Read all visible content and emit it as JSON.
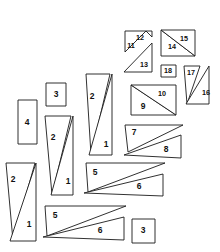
{
  "canvas": {
    "width": 220,
    "height": 252,
    "background": "#ffffff",
    "stroke_color": "#1a1a1a",
    "label_color": "#111111",
    "type": "packing-diagram"
  },
  "pieces": [
    {
      "id": "p-4",
      "label": "4",
      "shape": "rectangle",
      "points": "18,100 37,100 37,144 18,144"
    },
    {
      "id": "p-3-upper",
      "label": "3",
      "shape": "rectangle",
      "points": "46,83 66,83 66,106 46,106"
    },
    {
      "id": "p-3-lower",
      "label": "3",
      "shape": "rectangle",
      "points": "132,219 155,219 155,243 132,243"
    },
    {
      "id": "p-2-left",
      "label": "2",
      "shape": "triangle",
      "points": "6,163 35,163 13,241"
    },
    {
      "id": "p-1-left",
      "label": "1",
      "shape": "triangle",
      "points": "36,163 36,241 10,241"
    },
    {
      "id": "p-2-mid",
      "label": "2",
      "shape": "triangle",
      "points": "45,116 71,116 52,195"
    },
    {
      "id": "p-1-mid",
      "label": "1",
      "shape": "triangle",
      "points": "73,116 73,195 51,195"
    },
    {
      "id": "p-2-tall",
      "label": "2",
      "shape": "triangle",
      "points": "86,74 110,74 91,155"
    },
    {
      "id": "p-1-tall",
      "label": "1",
      "shape": "triangle",
      "points": "112,74 112,155 89,155"
    },
    {
      "id": "p-7",
      "label": "7",
      "shape": "triangle",
      "points": "125,125 183,125 128,152"
    },
    {
      "id": "p-8",
      "label": "8",
      "shape": "triangle",
      "points": "181,135 181,158 124,155"
    },
    {
      "id": "p-5-mid",
      "label": "5",
      "shape": "triangle",
      "points": "86,163 165,163 88,192"
    },
    {
      "id": "p-6-mid",
      "label": "6",
      "shape": "triangle",
      "points": "163,174 163,196 84,193"
    },
    {
      "id": "p-5-low",
      "label": "5",
      "shape": "triangle",
      "points": "45,206 126,206 47,236"
    },
    {
      "id": "p-6-low",
      "label": "6",
      "shape": "triangle",
      "points": "124,217 124,240 43,237"
    },
    {
      "id": "p-9",
      "label": "9",
      "shape": "triangle",
      "points": "131,85 131,115 176,115"
    },
    {
      "id": "p-10",
      "label": "10",
      "shape": "triangle",
      "points": "131,85 176,85 176,115"
    },
    {
      "id": "p-11",
      "label": "11",
      "shape": "triangle",
      "points": "125,31 146,31 125,52"
    },
    {
      "id": "p-12",
      "label": "12",
      "shape": "triangle",
      "points": "146,31 152,31 152,37"
    },
    {
      "id": "p-13",
      "label": "13",
      "shape": "triangle",
      "points": "152,43 152,72 124,72"
    },
    {
      "id": "p-14",
      "label": "14",
      "shape": "triangle",
      "points": "161,30 161,56 195,56"
    },
    {
      "id": "p-15",
      "label": "15",
      "shape": "triangle",
      "points": "161,30 195,30 195,56"
    },
    {
      "id": "p-18",
      "label": "18",
      "shape": "rectangle",
      "points": "161,65 176,65 176,77 161,77"
    },
    {
      "id": "p-17",
      "label": "17",
      "shape": "triangle",
      "points": "184,66 200,66 187,104"
    },
    {
      "id": "p-16",
      "label": "16",
      "shape": "triangle",
      "points": "209,66 209,104 186,104"
    }
  ],
  "labels": [
    {
      "for": "p-4",
      "text": "4",
      "x": 27,
      "y": 123
    },
    {
      "for": "p-3-upper",
      "text": "3",
      "x": 56,
      "y": 95
    },
    {
      "for": "p-3-lower",
      "text": "3",
      "x": 143,
      "y": 231
    },
    {
      "for": "p-2-left",
      "text": "2",
      "x": 13,
      "y": 180
    },
    {
      "for": "p-1-left",
      "text": "1",
      "x": 29,
      "y": 225
    },
    {
      "for": "p-2-mid",
      "text": "2",
      "x": 53,
      "y": 138
    },
    {
      "for": "p-1-mid",
      "text": "1",
      "x": 68,
      "y": 182
    },
    {
      "for": "p-2-tall",
      "text": "2",
      "x": 92,
      "y": 97
    },
    {
      "for": "p-1-tall",
      "text": "1",
      "x": 106,
      "y": 145
    },
    {
      "for": "p-7",
      "text": "7",
      "x": 134,
      "y": 133
    },
    {
      "for": "p-8",
      "text": "8",
      "x": 166,
      "y": 150
    },
    {
      "for": "p-5-mid",
      "text": "5",
      "x": 95,
      "y": 173
    },
    {
      "for": "p-6-mid",
      "text": "6",
      "x": 139,
      "y": 187
    },
    {
      "for": "p-5-low",
      "text": "5",
      "x": 55,
      "y": 216
    },
    {
      "for": "p-6-low",
      "text": "6",
      "x": 100,
      "y": 231
    },
    {
      "for": "p-9",
      "text": "9",
      "x": 143,
      "y": 107
    },
    {
      "for": "p-10",
      "text": "10",
      "x": 162,
      "y": 94
    },
    {
      "for": "p-11",
      "text": "11",
      "x": 131,
      "y": 46
    },
    {
      "for": "p-12",
      "text": "12",
      "x": 140,
      "y": 38
    },
    {
      "for": "p-13",
      "text": "13",
      "x": 144,
      "y": 65
    },
    {
      "for": "p-14",
      "text": "14",
      "x": 172,
      "y": 47
    },
    {
      "for": "p-15",
      "text": "15",
      "x": 184,
      "y": 39
    },
    {
      "for": "p-18",
      "text": "18",
      "x": 168,
      "y": 71
    },
    {
      "for": "p-17",
      "text": "17",
      "x": 191,
      "y": 73
    },
    {
      "for": "p-16",
      "text": "16",
      "x": 206,
      "y": 93
    }
  ]
}
